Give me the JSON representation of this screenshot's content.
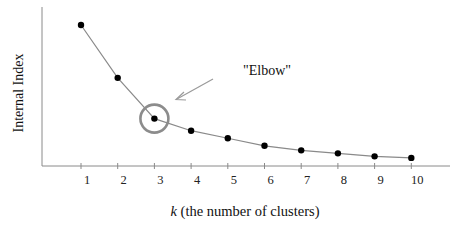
{
  "chart_data": {
    "type": "line",
    "title": "",
    "xlabel_var": "k",
    "xlabel_rest": " (the number of clusters)",
    "xlabel": "k (the number of clusters)",
    "ylabel": "Internal Index",
    "x": [
      1,
      2,
      3,
      4,
      5,
      6,
      7,
      8,
      9,
      10
    ],
    "x_tick_labels": [
      "1",
      "2",
      "3",
      "4",
      "5",
      "6",
      "7",
      "8",
      "9",
      "10"
    ],
    "values": [
      100,
      65,
      38,
      30,
      25,
      20,
      17,
      15,
      13,
      12
    ],
    "y_ticks_shown": false,
    "ylim": [
      0,
      110
    ],
    "grid": false,
    "legend": null,
    "annotations": [
      {
        "text": "\"Elbow\"",
        "target_x": 3,
        "style": "circle + arrow"
      }
    ],
    "colors": {
      "line": "#888888",
      "marker": "#000000",
      "circle": "#8a8a8a",
      "arrow": "#999999",
      "axis": "#888888"
    }
  }
}
